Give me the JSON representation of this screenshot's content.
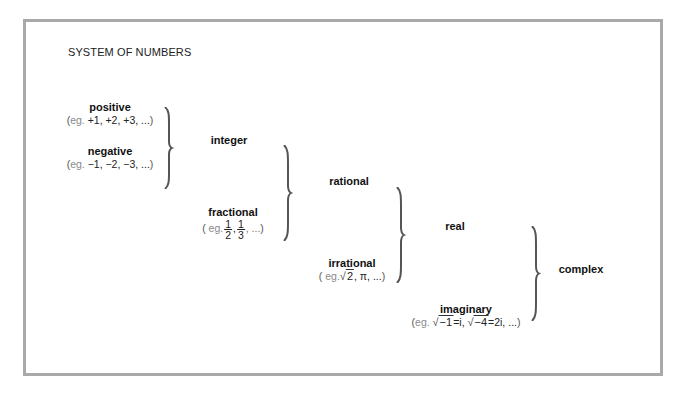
{
  "title": "SYSTEM OF NUMBERS",
  "nodes": {
    "positive": {
      "label": "positive",
      "eg": "eg.",
      "example": "+1, +2, +3, ...",
      "open": "(",
      "close": ")"
    },
    "negative": {
      "label": "negative",
      "eg": "eg.",
      "example": "−1, −2, −3, ...",
      "open": "(",
      "close": ")"
    },
    "integer": {
      "label": "integer"
    },
    "fractional": {
      "label": "fractional",
      "eg": "eg.",
      "open": "(",
      "close": ")",
      "fractions": [
        {
          "num": "1",
          "den": "2"
        },
        {
          "num": "1",
          "den": "3"
        }
      ],
      "sep": ",",
      "trail": ", ..."
    },
    "rational": {
      "label": "rational"
    },
    "irrational": {
      "label": "irrational",
      "eg": "eg.",
      "open": "(",
      "close": ")",
      "radical": "√",
      "radicand": "2",
      "rest": ", π, ..."
    },
    "real": {
      "label": "real"
    },
    "imaginary": {
      "label": "imaginary",
      "eg": "eg.",
      "open": "(",
      "close": ")",
      "radical": "√",
      "radicand1": "−1",
      "eq1": "=i, ",
      "radicand2": "−4",
      "eq2": "=2i, ...",
      "close_text": ")"
    },
    "complex": {
      "label": "complex"
    }
  },
  "braces": [
    {
      "joins": [
        "positive",
        "negative"
      ],
      "result": "integer"
    },
    {
      "joins": [
        "integer",
        "fractional"
      ],
      "result": "rational"
    },
    {
      "joins": [
        "rational",
        "irrational"
      ],
      "result": "real"
    },
    {
      "joins": [
        "real",
        "imaginary"
      ],
      "result": "complex"
    }
  ],
  "colors": {
    "frame": "#a9a9a9",
    "text": "#111111",
    "eg_text": "#8a8a8a",
    "brace": "#555555"
  }
}
